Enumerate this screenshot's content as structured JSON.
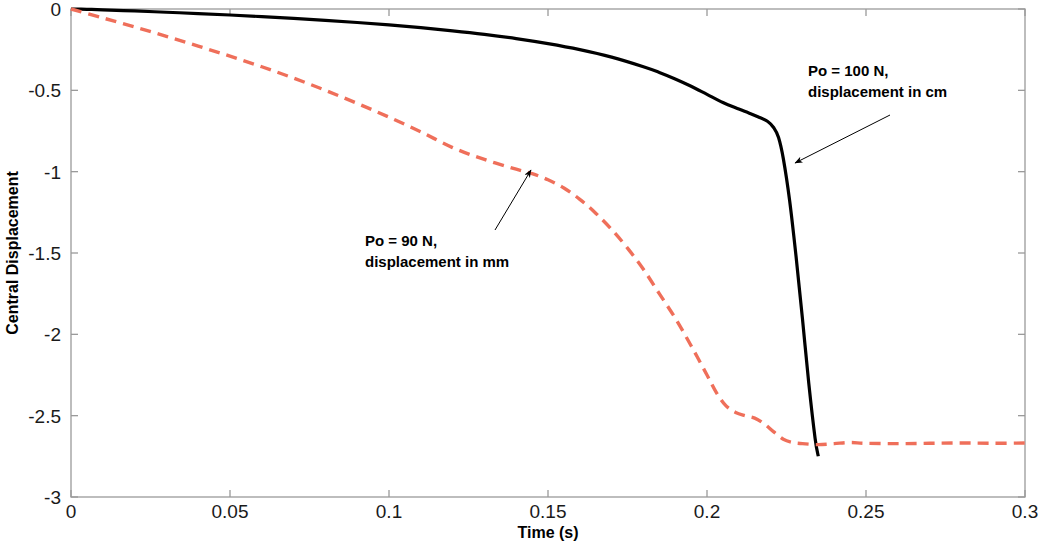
{
  "chart_data": {
    "type": "line",
    "title": "",
    "xlabel": "Time (s)",
    "ylabel": "Central Displacement",
    "xlim": [
      0,
      0.3
    ],
    "ylim": [
      -3,
      0
    ],
    "xticks": [
      0,
      0.05,
      0.1,
      0.15,
      0.2,
      0.25,
      0.3
    ],
    "xticklabels": [
      "0",
      "0.05",
      "0.1",
      "0.15",
      "0.2",
      "0.25",
      "0.3"
    ],
    "yticks": [
      -3,
      -2.5,
      -2,
      -1.5,
      -1,
      -0.5,
      0
    ],
    "yticklabels": [
      "-3",
      "-2.5",
      "-2",
      "-1.5",
      "-1",
      "-0.5",
      "0"
    ],
    "grid": false,
    "legend": "none",
    "series": [
      {
        "name": "Po = 100 N, displacement in cm",
        "style": "solid",
        "color": "#000000",
        "width": 3.2,
        "x": [
          0,
          0.005,
          0.01,
          0.02,
          0.03,
          0.04,
          0.05,
          0.06,
          0.07,
          0.08,
          0.09,
          0.1,
          0.11,
          0.12,
          0.13,
          0.14,
          0.15,
          0.16,
          0.17,
          0.18,
          0.185,
          0.19,
          0.195,
          0.2,
          0.205,
          0.21,
          0.213,
          0.216,
          0.219,
          0.221,
          0.2225,
          0.224,
          0.226,
          0.228,
          0.23,
          0.232,
          0.234,
          0.235
        ],
        "y": [
          0,
          -0.002,
          -0.005,
          -0.012,
          -0.02,
          -0.028,
          -0.037,
          -0.047,
          -0.058,
          -0.07,
          -0.083,
          -0.098,
          -0.115,
          -0.134,
          -0.156,
          -0.182,
          -0.213,
          -0.25,
          -0.296,
          -0.355,
          -0.39,
          -0.43,
          -0.475,
          -0.525,
          -0.575,
          -0.615,
          -0.638,
          -0.662,
          -0.69,
          -0.73,
          -0.79,
          -0.92,
          -1.18,
          -1.52,
          -1.9,
          -2.3,
          -2.64,
          -2.75
        ]
      },
      {
        "name": "Po = 90 N, displacement in mm",
        "style": "dashed",
        "color": "#ef6f5a",
        "width": 3.4,
        "dash": [
          11,
          7
        ],
        "x": [
          0,
          0.01,
          0.02,
          0.03,
          0.04,
          0.05,
          0.06,
          0.07,
          0.08,
          0.09,
          0.1,
          0.11,
          0.12,
          0.13,
          0.14,
          0.145,
          0.15,
          0.155,
          0.16,
          0.165,
          0.17,
          0.175,
          0.18,
          0.185,
          0.19,
          0.195,
          0.2,
          0.203,
          0.206,
          0.209,
          0.212,
          0.215,
          0.218,
          0.221,
          0.224,
          0.227,
          0.23,
          0.235,
          0.24,
          0.245,
          0.25,
          0.26,
          0.27,
          0.28,
          0.29,
          0.3
        ],
        "y": [
          0,
          -0.055,
          -0.11,
          -0.168,
          -0.228,
          -0.29,
          -0.355,
          -0.425,
          -0.5,
          -0.58,
          -0.665,
          -0.755,
          -0.852,
          -0.925,
          -0.985,
          -1.012,
          -1.05,
          -1.1,
          -1.17,
          -1.255,
          -1.355,
          -1.47,
          -1.6,
          -1.75,
          -1.9,
          -2.07,
          -2.25,
          -2.36,
          -2.44,
          -2.48,
          -2.5,
          -2.515,
          -2.55,
          -2.6,
          -2.645,
          -2.665,
          -2.672,
          -2.678,
          -2.672,
          -2.665,
          -2.67,
          -2.672,
          -2.67,
          -2.668,
          -2.67,
          -2.668
        ]
      }
    ],
    "annotations": [
      {
        "id": "annot-100n",
        "line1": "Po = 100 N,",
        "line2": "displacement in cm",
        "text_x": 808,
        "text_y": 76,
        "arrow_from": [
          890,
          115
        ],
        "arrow_to": [
          795,
          163
        ]
      },
      {
        "id": "annot-90n",
        "line1": "Po = 90 N,",
        "line2": "displacement in mm",
        "text_x": 365,
        "text_y": 246,
        "arrow_from": [
          495,
          230
        ],
        "arrow_to": [
          531,
          170
        ]
      }
    ]
  },
  "axes": {
    "plot_left": 71,
    "plot_right": 1025,
    "plot_top": 9,
    "plot_bottom": 497,
    "frame_color": "#9a9a9a"
  }
}
